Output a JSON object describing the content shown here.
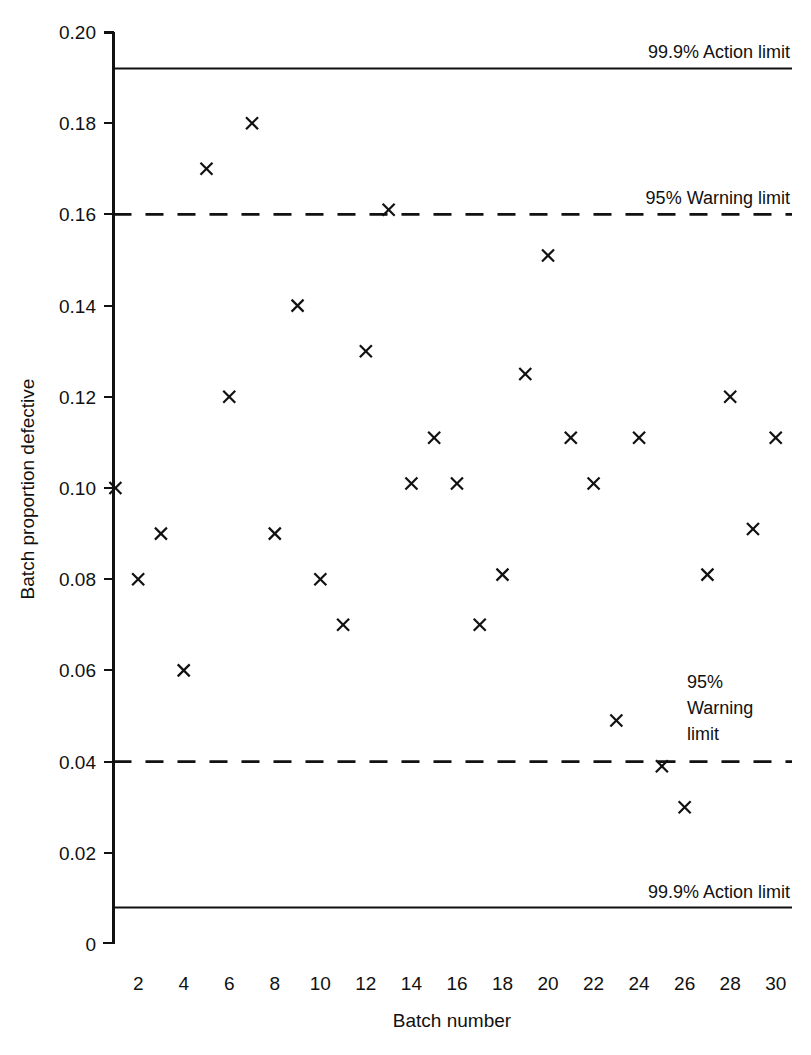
{
  "chart_data": {
    "type": "scatter",
    "title": "",
    "xlabel": "Batch number",
    "ylabel": "Batch proportion defective",
    "xlim": [
      0.2,
      30.8
    ],
    "ylim": [
      0,
      0.2
    ],
    "grid": false,
    "legend": "none",
    "marker": "x",
    "x": [
      1,
      2,
      3,
      4,
      5,
      6,
      7,
      8,
      9,
      10,
      11,
      12,
      13,
      14,
      15,
      16,
      17,
      18,
      19,
      20,
      21,
      22,
      23,
      24,
      25,
      26,
      27,
      28,
      29,
      30
    ],
    "values": [
      0.1,
      0.08,
      0.09,
      0.06,
      0.17,
      0.12,
      0.18,
      0.09,
      0.14,
      0.08,
      0.07,
      0.13,
      0.161,
      0.101,
      0.111,
      0.101,
      0.07,
      0.081,
      0.125,
      0.151,
      0.111,
      0.101,
      0.049,
      0.111,
      0.039,
      0.03,
      0.081,
      0.12,
      0.091,
      0.111
    ],
    "xticks": [
      2,
      4,
      6,
      8,
      10,
      12,
      14,
      16,
      18,
      20,
      22,
      24,
      26,
      28,
      30
    ],
    "xtick_labels": [
      "2",
      "4",
      "6",
      "8",
      "10",
      "12",
      "14",
      "16",
      "18",
      "20",
      "22",
      "24",
      "26",
      "28",
      "30"
    ],
    "yticks": [
      0,
      0.02,
      0.04,
      0.06,
      0.08,
      0.1,
      0.12,
      0.14,
      0.16,
      0.18,
      0.2
    ],
    "ytick_labels": [
      "0",
      "0.02",
      "0.04",
      "0.06",
      "0.08",
      "0.10",
      "0.12",
      "0.14",
      "0.16",
      "0.18",
      "0.20"
    ],
    "reference_lines": [
      {
        "id": "upper-action-limit",
        "value": 0.192,
        "style": "solid",
        "label": "99.9% Action limit",
        "label_lines": [
          "99.9% Action limit"
        ],
        "label_position": "above-right"
      },
      {
        "id": "upper-warning-limit",
        "value": 0.16,
        "style": "dashed",
        "label": "95% Warning limit",
        "label_lines": [
          "95% Warning limit"
        ],
        "label_position": "above-right"
      },
      {
        "id": "lower-warning-limit",
        "value": 0.04,
        "style": "dashed",
        "label": "95% Warning limit",
        "label_lines": [
          "95%",
          "Warning",
          "limit"
        ],
        "label_position": "above-inside-right"
      },
      {
        "id": "lower-action-limit",
        "value": 0.008,
        "style": "solid",
        "label": "99.9% Action limit",
        "label_lines": [
          "99.9% Action limit"
        ],
        "label_position": "above-right"
      }
    ]
  },
  "axes": {
    "x_title": "Batch number",
    "y_title": "Batch proportion defective"
  },
  "colors": {
    "ink": "#111111",
    "background": "#ffffff"
  }
}
